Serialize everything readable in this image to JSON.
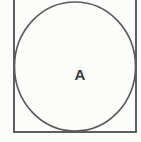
{
  "figure": {
    "label": "A",
    "stroke_color": "#4e4e4e",
    "circle_stroke_color": "#5a5a5a",
    "label_color": "#3a3a3a",
    "background_color": "#fcfcfa"
  },
  "geometry": {
    "square": {
      "left": 14,
      "top_cutoff": true,
      "right": 136,
      "bottom": 132
    },
    "circle": {
      "cx": 75,
      "cy": 66.5,
      "rx": 60.5,
      "ry": 64.5
    },
    "label_position": {
      "x": 80,
      "y": 79.5
    }
  }
}
